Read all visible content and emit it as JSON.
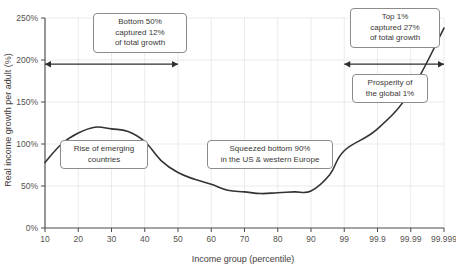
{
  "chart_data": {
    "type": "line",
    "title": "",
    "xlabel": "Income group (percentile)",
    "ylabel": "Real income growth per adult (%)",
    "xtick_labels": [
      "10",
      "20",
      "30",
      "40",
      "50",
      "60",
      "70",
      "80",
      "90",
      "99",
      "99.9",
      "99.99",
      "99.999"
    ],
    "ytick_labels": [
      "0%",
      "50%",
      "100%",
      "150%",
      "200%",
      "250%"
    ],
    "ylim": [
      0,
      250
    ],
    "grid": true,
    "legend": "none",
    "series": [
      {
        "name": "Real income growth per adult",
        "x": [
          "10",
          "15",
          "20",
          "25",
          "30",
          "35",
          "40",
          "45",
          "50",
          "55",
          "60",
          "65",
          "70",
          "75",
          "80",
          "85",
          "90",
          "95",
          "99",
          "99.9",
          "99.99",
          "99.999"
        ],
        "values": [
          78,
          100,
          113,
          120,
          118,
          115,
          103,
          80,
          66,
          58,
          52,
          45,
          43,
          41,
          42,
          43,
          44,
          63,
          92,
          118,
          163,
          238
        ]
      }
    ],
    "annotations": [
      {
        "name": "bottom-50-callout",
        "text": "Bottom 50%\ncaptured 12%\nof total growth"
      },
      {
        "name": "top-1-callout",
        "text": "Top 1%\ncaptured 27%\nof total growth"
      },
      {
        "name": "emerging-countries-callout",
        "text": "Rise of emerging\ncountries"
      },
      {
        "name": "squeezed-bottom-90-callout",
        "text": "Squeezed bottom 90%\nin the US & western Europe"
      },
      {
        "name": "global-1-callout",
        "text": "Prosperity of\nthe global 1%"
      }
    ],
    "span_arrows": [
      {
        "name": "bottom-50-span",
        "from": "10",
        "to": "50",
        "at_value": 195
      },
      {
        "name": "top-1-span",
        "from": "99",
        "to": "99.999",
        "at_value": 195
      }
    ],
    "colors": {
      "curve": "#333331",
      "axis": "#4a4a48",
      "grid": "#e3e3e1",
      "text": "#3a3836",
      "background": "#ffffff"
    }
  }
}
